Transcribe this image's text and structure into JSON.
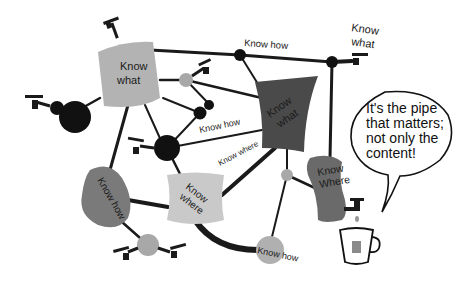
{
  "diagram": {
    "colors": {
      "background": "#ffffff",
      "pipe": "#1a1a1a",
      "node_dark": "#111111",
      "node_light": "#a8a8a8",
      "blob_light": "#b3b3b3",
      "blob_mid": "#7a7a7a",
      "blob_dark": "#4a4a4a",
      "blob_pale": "#c9c9c9"
    },
    "containers": [
      {
        "id": "c1",
        "label_line1": "Know",
        "label_line2": "what",
        "shade": "light"
      },
      {
        "id": "c2",
        "label_line1": "Know",
        "label_line2": "what",
        "shade": "dark"
      },
      {
        "id": "c3",
        "label_line1": "Know how",
        "shade": "mid"
      },
      {
        "id": "c4",
        "label_line1": "Know",
        "label_line2": "where",
        "shade": "pale"
      },
      {
        "id": "c5",
        "label_line1": "Know",
        "label_line2": "Where",
        "shade": "mid"
      }
    ],
    "pipe_labels": [
      {
        "id": "p1",
        "text": "Know how"
      },
      {
        "id": "p2",
        "text": "Know how"
      },
      {
        "id": "p3",
        "text": "Know where"
      },
      {
        "id": "p4",
        "text": "Know how"
      }
    ],
    "tap_label": {
      "line1": "Know",
      "line2": "what"
    },
    "speech_bubble": {
      "line1": "It's the pipe",
      "line2": "that matters;",
      "line3": "not only the",
      "line4": "content!"
    }
  }
}
